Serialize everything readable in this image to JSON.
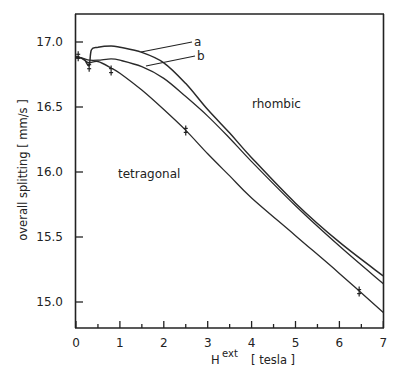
{
  "chart_data": {
    "type": "line",
    "title": "",
    "xlabel": "H ext [tesla]",
    "xlabel_main": "H",
    "xlabel_sup": "ext",
    "xlabel_unit": "[ tesla ]",
    "ylabel": "overall splitting [ mm/s ]",
    "xlim": [
      0,
      7
    ],
    "ylim": [
      14.8,
      17.2
    ],
    "x_ticks": [
      0,
      1,
      2,
      3,
      4,
      5,
      6,
      7
    ],
    "x_tick_labels": [
      "0",
      "1",
      "2",
      "3",
      "4",
      "5",
      "6",
      "7"
    ],
    "y_ticks": [
      15.0,
      15.5,
      16.0,
      16.5,
      17.0
    ],
    "y_tick_labels": [
      "15.0",
      "15.5",
      "16.0",
      "16.5",
      "17.0"
    ],
    "grid": false,
    "legend": "inline curve labels",
    "annotations": [
      "a",
      "b",
      "rhombic",
      "tetragonal"
    ],
    "series": [
      {
        "name": "a",
        "x": [
          0,
          0.1,
          0.2,
          0.3,
          0.35,
          0.5,
          0.8,
          1.0,
          1.5,
          2.0,
          2.5,
          3.0,
          3.5,
          4.0,
          5.0,
          6.0,
          7.0
        ],
        "values": [
          16.88,
          16.88,
          16.86,
          16.82,
          16.94,
          16.96,
          16.97,
          16.96,
          16.92,
          16.84,
          16.68,
          16.48,
          16.3,
          16.11,
          15.76,
          15.46,
          15.2
        ]
      },
      {
        "name": "b",
        "x": [
          0,
          0.1,
          0.2,
          0.3,
          0.5,
          0.8,
          1.0,
          1.5,
          2.0,
          2.5,
          3.0,
          3.5,
          4.0,
          5.0,
          6.0,
          7.0
        ],
        "values": [
          16.88,
          16.88,
          16.87,
          16.86,
          16.86,
          16.87,
          16.86,
          16.81,
          16.72,
          16.58,
          16.43,
          16.26,
          16.08,
          15.74,
          15.43,
          15.14
        ]
      },
      {
        "name": "tetragonal",
        "x": [
          0,
          0.1,
          0.2,
          0.3,
          0.5,
          0.8,
          1.0,
          1.5,
          2.0,
          2.5,
          3.0,
          3.5,
          4.0,
          5.0,
          6.0,
          7.0
        ],
        "values": [
          16.89,
          16.88,
          16.86,
          16.84,
          16.85,
          16.8,
          16.76,
          16.63,
          16.48,
          16.32,
          16.14,
          15.97,
          15.8,
          15.51,
          15.22,
          14.92
        ]
      }
    ],
    "data_points": [
      {
        "x": 0.05,
        "y": 16.89,
        "series": "tetragonal"
      },
      {
        "x": 0.3,
        "y": 16.81,
        "series": "tetragonal"
      },
      {
        "x": 0.8,
        "y": 16.78,
        "series": "tetragonal"
      },
      {
        "x": 2.5,
        "y": 16.32,
        "series": "tetragonal"
      },
      {
        "x": 6.45,
        "y": 15.08,
        "series": "tetragonal"
      }
    ]
  }
}
